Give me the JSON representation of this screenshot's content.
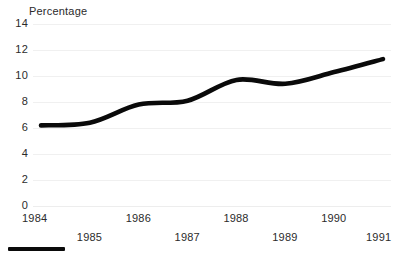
{
  "chart_data": {
    "type": "line",
    "title": "",
    "ylabel": "Percentage",
    "xlabel": "",
    "ylim": [
      0,
      14
    ],
    "ytick_values": [
      0,
      2,
      4,
      6,
      8,
      10,
      12,
      14
    ],
    "ytick_labels": [
      "0",
      "2",
      "4",
      "6",
      "8",
      "10",
      "12",
      "14"
    ],
    "xlim": [
      1984,
      1991
    ],
    "categories": [
      "1984",
      "1985",
      "1986",
      "1987",
      "1988",
      "1989",
      "1990",
      "1991"
    ],
    "values": [
      6.2,
      6.4,
      7.8,
      8.1,
      9.7,
      9.4,
      10.3,
      11.3
    ],
    "series": [
      {
        "name": "Percentage",
        "values": [
          6.2,
          6.4,
          7.8,
          8.1,
          9.7,
          9.4,
          10.3,
          11.3
        ]
      }
    ],
    "grid": true,
    "grid_color": "#f0f0f0",
    "legend": "none",
    "line_color": "#0a0a0a",
    "line_width": 4.6,
    "x_labels_staggered": true
  },
  "axis": {
    "y_title": "Percentage",
    "yticks": [
      {
        "label": "14",
        "value": 14
      },
      {
        "label": "12",
        "value": 12
      },
      {
        "label": "10",
        "value": 10
      },
      {
        "label": "8",
        "value": 8
      },
      {
        "label": "6",
        "value": 6
      },
      {
        "label": "4",
        "value": 4
      },
      {
        "label": "2",
        "value": 2
      },
      {
        "label": "0",
        "value": 0
      }
    ],
    "xticks": [
      {
        "label": "1984",
        "row": "top"
      },
      {
        "label": "1985",
        "row": "bottom"
      },
      {
        "label": "1986",
        "row": "top"
      },
      {
        "label": "1987",
        "row": "bottom"
      },
      {
        "label": "1988",
        "row": "top"
      },
      {
        "label": "1989",
        "row": "bottom"
      },
      {
        "label": "1990",
        "row": "top"
      },
      {
        "label": "1991",
        "row": "bottom"
      }
    ]
  },
  "legend": {
    "label": "",
    "color": "#0a0a0a"
  },
  "colors": {
    "line": "#0a0a0a",
    "text": "#2b2b2b",
    "grid": "#f0f0f0",
    "background": "#ffffff"
  }
}
